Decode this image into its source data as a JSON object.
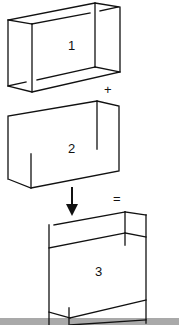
{
  "diagram": {
    "colors": {
      "line": "#111111",
      "background": "#ffffff",
      "ground": "#a9a9a9"
    },
    "boxes": [
      {
        "id": "box-1",
        "label": "1"
      },
      {
        "id": "box-2",
        "label": "2"
      },
      {
        "id": "box-3",
        "label": "3"
      }
    ],
    "operators": {
      "plus": "+",
      "equals": "="
    },
    "arrow": {
      "direction": "down"
    },
    "ground": {
      "present": true
    }
  }
}
